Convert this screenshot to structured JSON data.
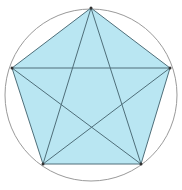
{
  "diagram": {
    "colors": {
      "fill": "#b9e6f2",
      "circle_stroke": "#9a9a9a",
      "edge_stroke": "#4f6f7a",
      "vertex": "#333333"
    },
    "circle": {
      "cx": 91,
      "cy": 95,
      "r": 86
    },
    "vertices": [
      {
        "id": "top",
        "x": 91,
        "y": 8
      },
      {
        "id": "right",
        "x": 170,
        "y": 68
      },
      {
        "id": "bottom-right",
        "x": 141,
        "y": 164
      },
      {
        "id": "bottom-left",
        "x": 43,
        "y": 164
      },
      {
        "id": "left",
        "x": 12,
        "y": 68
      }
    ]
  }
}
